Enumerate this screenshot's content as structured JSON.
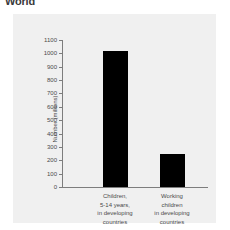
{
  "heading": {
    "text": "World"
  },
  "chart_data": {
    "type": "bar",
    "title": "",
    "xlabel": "",
    "ylabel": "Number (millions)",
    "ylim": [
      0,
      1100
    ],
    "ytick_step": 100,
    "grid": false,
    "legend": false,
    "bar_color": "#000000",
    "categories": [
      "Children,\n5-14 years,\nin developing\ncountries",
      "Working\nchildren\nin developing\ncountries"
    ],
    "category_lines": [
      [
        "Children,",
        "5-14 years,",
        "in developing",
        "countries"
      ],
      [
        "Working",
        "children",
        "in developing",
        "countries"
      ]
    ],
    "values": [
      1020,
      250
    ],
    "ytick_labels": [
      "1100",
      "1000",
      "900",
      "800",
      "700",
      "600",
      "500",
      "400",
      "300",
      "200",
      "100",
      "0"
    ],
    "ytick_values": [
      1100,
      1000,
      900,
      800,
      700,
      600,
      500,
      400,
      300,
      200,
      100,
      0
    ]
  }
}
